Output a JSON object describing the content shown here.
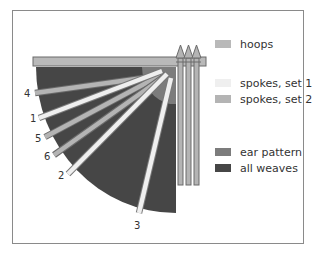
{
  "diagram": {
    "title": "",
    "colors": {
      "hoops": "#b9b9b9",
      "spokes_set_1": "#efefef",
      "spokes_set_2": "#b4b4b4",
      "ear_pattern": "#7c7c7c",
      "all_weaves": "#464646",
      "frame": "#8a8a8a"
    },
    "spoke_labels": [
      {
        "id": "4",
        "set": 2
      },
      {
        "id": "1",
        "set": 1
      },
      {
        "id": "5",
        "set": 2
      },
      {
        "id": "6",
        "set": 2
      },
      {
        "id": "2",
        "set": 1
      },
      {
        "id": "3",
        "set": 1
      }
    ],
    "vertical_rods": 3
  },
  "legend": {
    "items": [
      {
        "label": "hoops",
        "color": "#b9b9b9"
      },
      {
        "label": "spokes, set 1",
        "color": "#efefef"
      },
      {
        "label": "spokes, set 2",
        "color": "#b4b4b4"
      },
      {
        "label": "ear pattern",
        "color": "#7c7c7c"
      },
      {
        "label": "all weaves",
        "color": "#464646"
      }
    ]
  }
}
